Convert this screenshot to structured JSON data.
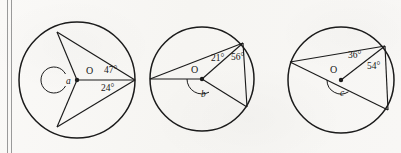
{
  "page": {
    "background_color": "#f8f7f5",
    "ink_color": "#1b1b1b",
    "margin_rule_color": "#9a9a9a",
    "width": 401,
    "height": 153
  },
  "margin": {
    "name": "double-vertical-rule",
    "line_count": 2
  },
  "figures": [
    {
      "id": "circle-1",
      "center_label": "O",
      "unknown_label": "a",
      "unknown_is_reflex": true,
      "center": {
        "x": 77,
        "y": 80
      },
      "radius": 58,
      "labels": [
        {
          "text": "O",
          "x": 86,
          "y": 74,
          "kind": "center"
        },
        {
          "text": "a",
          "x": 66,
          "y": 84,
          "kind": "variable"
        },
        {
          "text": "47°",
          "x": 104,
          "y": 73,
          "kind": "degree"
        },
        {
          "text": "24°",
          "x": 101,
          "y": 91,
          "kind": "degree"
        }
      ],
      "vertices": [
        {
          "name": "top-left",
          "x": 57,
          "y": 32
        },
        {
          "name": "right",
          "x": 135,
          "y": 80
        },
        {
          "name": "bottom-left",
          "x": 57,
          "y": 127
        }
      ],
      "arc": {
        "start_deg": 152,
        "end_deg": 238,
        "radius": 13
      }
    },
    {
      "id": "circle-2",
      "center_label": "O",
      "unknown_label": "b",
      "unknown_is_reflex": true,
      "center": {
        "x": 202,
        "y": 79
      },
      "radius": 52,
      "labels": [
        {
          "text": "O",
          "x": 194,
          "y": 73,
          "kind": "center"
        },
        {
          "text": "b",
          "x": 204,
          "y": 96,
          "kind": "variable"
        },
        {
          "text": "21°",
          "x": 215,
          "y": 60,
          "kind": "degree"
        },
        {
          "text": "56°",
          "x": 233,
          "y": 59,
          "kind": "degree"
        }
      ],
      "vertices": [
        {
          "name": "left",
          "x": 150,
          "y": 79
        },
        {
          "name": "top-right",
          "x": 243,
          "y": 43
        },
        {
          "name": "bottom-right",
          "x": 247,
          "y": 107
        }
      ],
      "arc": {
        "start_deg": 62,
        "end_deg": 180,
        "radius": 15
      }
    },
    {
      "id": "circle-3",
      "center_label": "O",
      "unknown_label": "c",
      "unknown_is_reflex": true,
      "center": {
        "x": 341,
        "y": 80
      },
      "radius": 53,
      "labels": [
        {
          "text": "O",
          "x": 333,
          "y": 72,
          "kind": "center"
        },
        {
          "text": "c",
          "x": 342,
          "y": 95,
          "kind": "variable"
        },
        {
          "text": "36°",
          "x": 352,
          "y": 57,
          "kind": "degree"
        },
        {
          "text": "54°",
          "x": 370,
          "y": 66,
          "kind": "degree"
        }
      ],
      "vertices": [
        {
          "name": "left",
          "x": 290,
          "y": 62
        },
        {
          "name": "top-right",
          "x": 385,
          "y": 46
        },
        {
          "name": "bottom-right",
          "x": 388,
          "y": 110
        }
      ],
      "arc": {
        "start_deg": 58,
        "end_deg": 182,
        "radius": 14
      }
    }
  ]
}
